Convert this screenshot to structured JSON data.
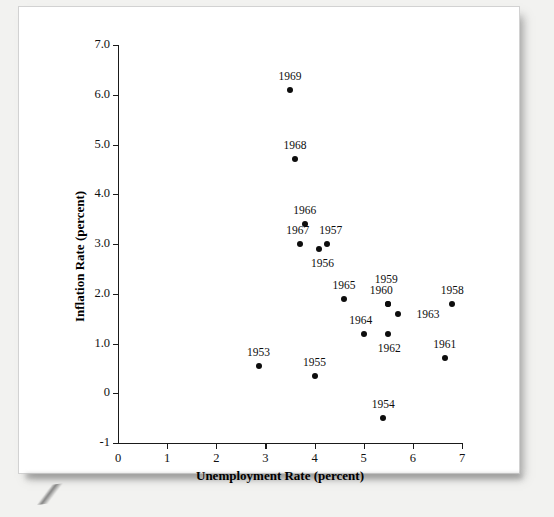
{
  "chart_data": {
    "type": "scatter",
    "title": "",
    "xlabel": "Unemployment Rate (percent)",
    "ylabel": "Inflation Rate (percent)",
    "xlim": [
      0,
      7
    ],
    "ylim": [
      -1,
      7
    ],
    "xticks": [
      "0",
      "1",
      "2",
      "3",
      "4",
      "5",
      "6",
      "7"
    ],
    "xtick_values": [
      0,
      1,
      2,
      3,
      4,
      5,
      6,
      7
    ],
    "yticks": [
      "-1",
      "0",
      "1.0",
      "2.0",
      "3.0",
      "4.0",
      "5.0",
      "6.0",
      "7.0"
    ],
    "ytick_values": [
      -1,
      0,
      1,
      2,
      3,
      4,
      5,
      6,
      7
    ],
    "grid": false,
    "legend": null,
    "point_labels": true,
    "marker_color": "#0d0d0d",
    "axis_color": "#1a1a1a",
    "points": [
      {
        "label": "1969",
        "x": 3.5,
        "y": 6.1,
        "label_dx": 0,
        "label_dy": -13
      },
      {
        "label": "1968",
        "x": 3.6,
        "y": 4.7,
        "label_dx": 0,
        "label_dy": -13
      },
      {
        "label": "1966",
        "x": 3.8,
        "y": 3.4,
        "label_dx": 0,
        "label_dy": -13
      },
      {
        "label": "1967",
        "x": 3.7,
        "y": 3.0,
        "label_dx": -2,
        "label_dy": -13
      },
      {
        "label": "1957",
        "x": 4.25,
        "y": 3.0,
        "label_dx": 4,
        "label_dy": -13
      },
      {
        "label": "1956",
        "x": 4.1,
        "y": 2.9,
        "label_dx": 3,
        "label_dy": 15
      },
      {
        "label": "1965",
        "x": 4.6,
        "y": 1.9,
        "label_dx": 0,
        "label_dy": -13
      },
      {
        "label": "1958",
        "x": 6.8,
        "y": 1.8,
        "label_dx": 0,
        "label_dy": -13
      },
      {
        "label": "1959",
        "x": 5.5,
        "y": 1.8,
        "label_dx": -2,
        "label_dy": -24
      },
      {
        "label": "1960",
        "x": 5.5,
        "y": 1.8,
        "label_dx": -7,
        "label_dy": -13
      },
      {
        "label": "1963",
        "x": 5.7,
        "y": 1.6,
        "label_dx": 30,
        "label_dy": 1
      },
      {
        "label": "1964",
        "x": 5.0,
        "y": 1.2,
        "label_dx": -3,
        "label_dy": -13
      },
      {
        "label": "1962",
        "x": 5.5,
        "y": 1.2,
        "label_dx": 1,
        "label_dy": 15
      },
      {
        "label": "1961",
        "x": 6.65,
        "y": 0.7,
        "label_dx": 0,
        "label_dy": -13
      },
      {
        "label": "1953",
        "x": 2.86,
        "y": 0.55,
        "label_dx": 0,
        "label_dy": -13
      },
      {
        "label": "1955",
        "x": 4.0,
        "y": 0.35,
        "label_dx": 0,
        "label_dy": -13
      },
      {
        "label": "1954",
        "x": 5.4,
        "y": -0.5,
        "label_dx": 0,
        "label_dy": -13
      }
    ]
  }
}
